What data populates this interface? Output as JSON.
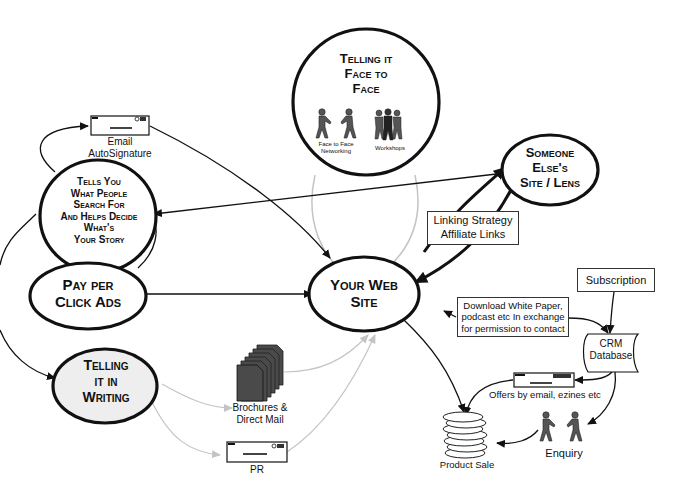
{
  "diagram": {
    "nodes": {
      "face_to_face": {
        "line1": "Telling it",
        "line2": "Face to",
        "line3": "Face"
      },
      "face_to_face_networking": {
        "line1": "Face to Face",
        "line2": "Networking"
      },
      "workshops": {
        "label": "Workshops"
      },
      "tells_you": {
        "line1": "Tells You",
        "line2": "What People",
        "line3": "Search For",
        "line4": "And Helps Decide",
        "line5": "What's",
        "line6": "Your Story"
      },
      "pay_per_click": {
        "line1": "Pay per",
        "line2": "Click Ads"
      },
      "telling_in_writing": {
        "line1": "Telling",
        "line2": "it in",
        "line3": "Writing"
      },
      "your_web_site": {
        "line1": "Your Web",
        "line2": "Site"
      },
      "someone_elses_site": {
        "line1": "Someone",
        "line2": "Else's",
        "line3": "Site / Lens"
      },
      "email_autosignature": {
        "line1": "Email",
        "line2": "AutoSignature"
      },
      "brochures": {
        "line1": "Brochures &",
        "line2": "Direct Mail"
      },
      "pr": {
        "label": "PR"
      },
      "linking_strategy": {
        "line1": "Linking Strategy",
        "line2": "Affiliate Links"
      },
      "download_white_paper": {
        "line1": "Download White Paper,",
        "line2": "podcast etc In exchange",
        "line3": "for permission to contact"
      },
      "subscription": {
        "label": "Subscription"
      },
      "crm_database": {
        "line1": "CRM",
        "line2": "Database"
      },
      "offers_by_email": {
        "label": "Offers by email, ezines etc"
      },
      "enquiry": {
        "label": "Enquiry"
      },
      "product_sale": {
        "label": "Product Sale"
      }
    },
    "colors": {
      "stroke": "#111111",
      "light_arrow": "#bdbdbd",
      "writing_fill": "#eeeeee",
      "figure_fill": "#555555",
      "doc_fill": "#4a4a4a"
    }
  }
}
